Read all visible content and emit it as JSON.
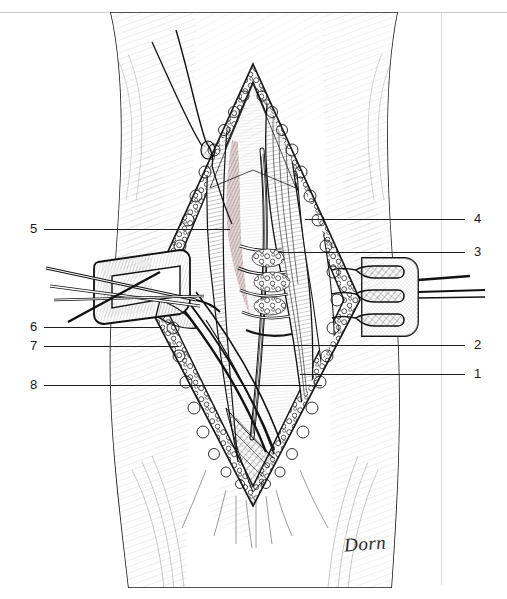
{
  "figure": {
    "style": "pen-and-ink anatomical line drawing",
    "signature": "Dorn",
    "background_color": "#ffffff",
    "ink_color": "#1a1a1a",
    "tissue_tint_color": "#c9a3a6"
  },
  "page_rules": {
    "top_rule_color": "#c9c9c9",
    "right_rule_color": "#dedede"
  },
  "callouts": {
    "left": [
      {
        "number": "5",
        "num_x": 30,
        "num_y": 222,
        "line_x": 44,
        "line_y": 229,
        "line_w": 186
      },
      {
        "number": "6",
        "num_x": 30,
        "num_y": 320,
        "line_x": 44,
        "line_y": 327,
        "line_w": 118
      },
      {
        "number": "7",
        "num_x": 30,
        "num_y": 339,
        "line_x": 44,
        "line_y": 346,
        "line_w": 135
      },
      {
        "number": "8",
        "num_x": 30,
        "num_y": 378,
        "line_x": 44,
        "line_y": 385,
        "line_w": 278
      }
    ],
    "right": [
      {
        "number": "4",
        "num_x": 474,
        "num_y": 212,
        "line_x": 305,
        "line_y": 219,
        "line_w": 160
      },
      {
        "number": "3",
        "num_x": 474,
        "num_y": 245,
        "line_x": 278,
        "line_y": 252,
        "line_w": 187
      },
      {
        "number": "2",
        "num_x": 474,
        "num_y": 338,
        "line_x": 262,
        "line_y": 345,
        "line_w": 203
      },
      {
        "number": "1",
        "num_x": 474,
        "num_y": 367,
        "line_x": 300,
        "line_y": 374,
        "line_w": 165
      }
    ]
  },
  "icons": {
    "retractor_right": "three-prong-retractor-icon",
    "retractor_left": "retractor-blade-icon",
    "forceps": "forceps-icon",
    "suture": "suture-thread-icon"
  }
}
